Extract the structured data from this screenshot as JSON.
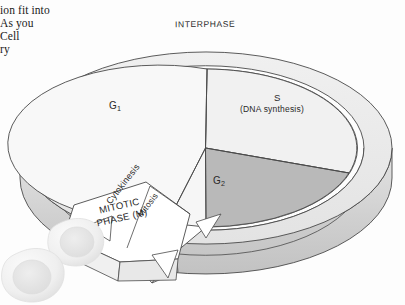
{
  "page": {
    "background_color": "#fdfdfd"
  },
  "body_text": {
    "lines": [
      "ion fit into",
      "As you",
      "Cell",
      "ry"
    ]
  },
  "diagram": {
    "name": "cell-cycle-disc",
    "outer_ring_label": "INTERPHASE",
    "phases": [
      {
        "id": "g1",
        "label": "G",
        "subscript": "1",
        "description": "",
        "fill": "#f7f7f7"
      },
      {
        "id": "s",
        "label": "S",
        "subscript": "",
        "description": "(DNA synthesis)",
        "fill": "#f2f2f2"
      },
      {
        "id": "g2",
        "label": "G",
        "subscript": "2",
        "description": "",
        "fill": "#b9b9b9"
      }
    ],
    "mitotic_phase": {
      "line1": "MITOTIC",
      "line2": "PHASE (M)",
      "sublabels": [
        "Cytokinesis",
        "Mitosis"
      ],
      "fill": "#ffffff"
    },
    "colors": {
      "top_face_light": "#f7f7f7",
      "top_face_mid": "#f1f1f1",
      "g2_fill": "#b9b9b9",
      "ring_fill": "#ececec",
      "ring_shade": "#dcdcdc",
      "rim_fill": "#d2d2d2",
      "rim_dark": "#bcbcbc",
      "outline": "#444444",
      "cell_fill": "#f0f0f0",
      "cell_nucleus": "#e2e2e2"
    }
  },
  "cells": [
    {
      "id": "cell-upper",
      "name": "daughter-cell-upper"
    },
    {
      "id": "cell-lower",
      "name": "daughter-cell-lower"
    }
  ]
}
